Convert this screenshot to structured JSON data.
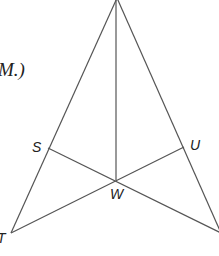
{
  "fragment_text": "M.)",
  "labels": {
    "S": "S",
    "U": "U",
    "W": "W",
    "T": "T"
  },
  "colors": {
    "line": "#555555",
    "text": "#222222",
    "background": "#ffffff"
  },
  "points": {
    "apex": [
      117,
      -2
    ],
    "T": [
      11,
      233
    ],
    "V": [
      221,
      233
    ],
    "S": [
      48,
      148
    ],
    "U": [
      184,
      147
    ],
    "W": [
      116,
      180
    ]
  }
}
